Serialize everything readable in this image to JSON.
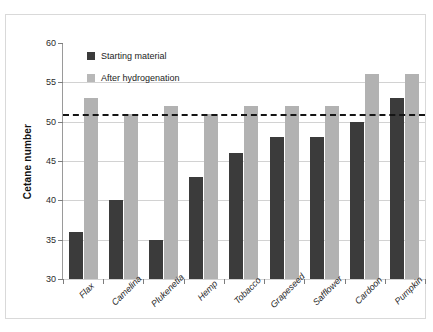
{
  "top_caption": "",
  "legend": {
    "position": "inside-top-left",
    "entries": [
      {
        "label": "Starting material",
        "color": "#3b3b3b"
      },
      {
        "label": "After hydrogenation",
        "color": "#b8b8b8"
      }
    ]
  },
  "axes": {
    "y_title": "Cetane number",
    "y_ticks": [
      "60",
      "55",
      "50",
      "45",
      "40",
      "35",
      "30"
    ]
  },
  "chart_data": {
    "type": "bar",
    "title": "",
    "xlabel": "",
    "ylabel": "Cetane number",
    "ylim": [
      30,
      60
    ],
    "ytick_step": 5,
    "grid": true,
    "legend_position": "inside-top-left",
    "categories": [
      "Flax",
      "Camelina",
      "Plukenetia",
      "Hemp",
      "Tobacco",
      "Grapeseed",
      "Safflower",
      "Cardoon",
      "Pumpkin"
    ],
    "series": [
      {
        "name": "Starting material",
        "color": "#3b3b3b",
        "values": [
          36,
          40,
          35,
          43,
          46,
          48,
          48,
          50,
          53
        ]
      },
      {
        "name": "After hydrogenation",
        "color": "#b2b2b2",
        "values": [
          53,
          51,
          52,
          51,
          52,
          52,
          52,
          56,
          56
        ]
      }
    ],
    "annotations": [
      {
        "type": "hline",
        "value": 51,
        "style": "dashed",
        "color": "#151515",
        "label": ""
      }
    ]
  }
}
